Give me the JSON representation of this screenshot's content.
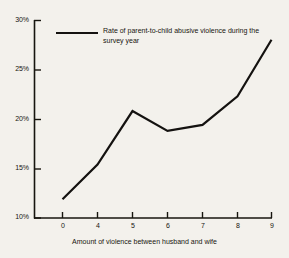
{
  "figure": {
    "background_color": "#f3f1ec",
    "ink_color": "#17150f"
  },
  "legend": {
    "line_1": "Rate of parent-to-child abusive violence",
    "line_2": "during the survey year",
    "swatch_name": "legend-line-sample"
  },
  "axes": {
    "y_tick_labels": [
      "30%",
      "25%",
      "20%",
      "15%",
      "10%"
    ],
    "x_tick_labels": [
      "0",
      "4",
      "5",
      "6",
      "7",
      "8",
      "9"
    ],
    "x_title": "Amount of violence between husband and wife",
    "y_title": ""
  },
  "chart_data": {
    "type": "line",
    "title": "",
    "subtitle": "",
    "xlabel": "Amount of violence between husband and wife",
    "ylabel": "",
    "x_tick_labels": [
      "0",
      "4",
      "5",
      "6",
      "7",
      "8",
      "9"
    ],
    "x": [
      0,
      4,
      5,
      6,
      7,
      8,
      9
    ],
    "categories": [
      "0",
      "4",
      "5",
      "6",
      "7",
      "8",
      "9"
    ],
    "values": [
      11.9,
      15.4,
      20.8,
      18.8,
      19.4,
      22.3,
      28.0
    ],
    "series": [
      {
        "name": "Rate of parent-to-child abusive violence during the survey year",
        "values": [
          11.9,
          15.4,
          20.8,
          18.8,
          19.4,
          22.3,
          28.0
        ]
      }
    ],
    "ylim": [
      10,
      30
    ],
    "y_ticks": [
      10,
      15,
      20,
      25,
      30
    ],
    "y_tick_labels": [
      "10%",
      "15%",
      "20%",
      "25%",
      "30%"
    ],
    "y_unit": "percent",
    "xlim_categorical": true,
    "grid": false,
    "legend_position": "upper-left-inside",
    "line_color": "#141210",
    "line_width": 2.2,
    "markers": false
  }
}
